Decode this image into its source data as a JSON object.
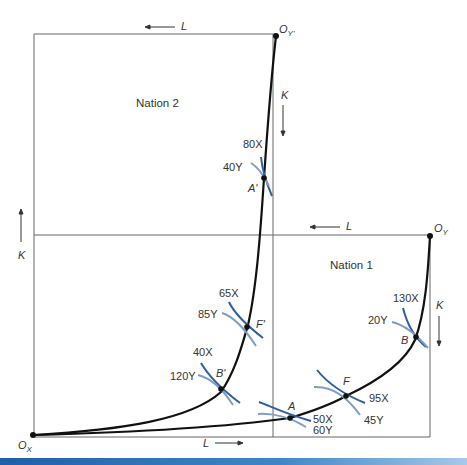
{
  "diagram": {
    "type": "edgeworth_box_diagram",
    "nations": [
      {
        "label": "Nation 1",
        "origin_x": "O_X",
        "origin_y": "O_Y"
      },
      {
        "label": "Nation 2",
        "origin_x": "O_X",
        "origin_y": "O_Y'"
      }
    ],
    "origins": {
      "ox": {
        "base": "O",
        "sub": "X"
      },
      "oy": {
        "base": "O",
        "sub": "Y"
      },
      "oyp": {
        "base": "O",
        "sub": "Y'"
      }
    },
    "axis_labels": {
      "top_L": "L",
      "nation1_L": "L",
      "left_K": "K",
      "nation2_K": "K",
      "nation1_K": "K",
      "bottom_L": "L"
    },
    "points": {
      "A": {
        "label": "A",
        "x_output": "50X",
        "y_output": "60Y"
      },
      "F": {
        "label": "F",
        "x_output": "95X",
        "y_output": "45Y"
      },
      "B": {
        "label": "B",
        "x_output": "130X",
        "y_output": "20Y"
      },
      "A_prime": {
        "label": "A'",
        "x_output": "80X",
        "y_output": "40Y"
      },
      "F_prime": {
        "label": "F'",
        "x_output": "65X",
        "y_output": "85Y"
      },
      "B_prime": {
        "label": "B'",
        "x_output": "40X",
        "y_output": "120Y"
      }
    },
    "colors": {
      "line": "#111111",
      "box": "#555555",
      "isoquant_x": "#2f5f9f",
      "isoquant_y": "#7e9cc6",
      "text": "#333333"
    }
  }
}
